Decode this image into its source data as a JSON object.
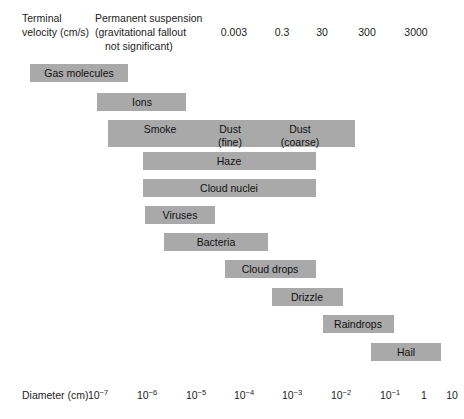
{
  "header": {
    "velocity_label_line1": "Terminal",
    "velocity_label_line2": "velocity (cm/s)",
    "suspension_line1": "Permanent suspension",
    "suspension_line2": "(gravitational fallout",
    "suspension_line3": "not significant)"
  },
  "velocity_values": [
    {
      "label": "0.003",
      "x": 234
    },
    {
      "label": "0.3",
      "x": 282
    },
    {
      "label": "30",
      "x": 322
    },
    {
      "label": "300",
      "x": 367
    },
    {
      "label": "3000",
      "x": 416
    }
  ],
  "axis": {
    "label": "Diameter (cm)",
    "ticks": [
      {
        "base": "10",
        "exp": "−7",
        "x": 98
      },
      {
        "base": "10",
        "exp": "−6",
        "x": 147
      },
      {
        "base": "10",
        "exp": "−5",
        "x": 196
      },
      {
        "base": "10",
        "exp": "−4",
        "x": 244
      },
      {
        "base": "10",
        "exp": "−3",
        "x": 292
      },
      {
        "base": "10",
        "exp": "−2",
        "x": 341
      },
      {
        "base": "10",
        "exp": "−1",
        "x": 390
      },
      {
        "base": "1",
        "exp": "",
        "x": 424
      },
      {
        "base": "10",
        "exp": "",
        "x": 452
      }
    ]
  },
  "chart_data": {
    "type": "bar",
    "title": "",
    "xlabel": "Diameter (cm)",
    "ylabel": "",
    "xlim": [
      "1e-7",
      "1e1"
    ],
    "grid": false,
    "legend": "none",
    "bars": [
      {
        "name": "Gas molecules",
        "labels": [
          "Gas molecules"
        ],
        "x": 30,
        "y": 64,
        "width": 98,
        "height": 18,
        "label_positions": [
          {
            "cx": 79,
            "cy": 67
          }
        ],
        "x_start": "1e-7.4",
        "x_end": "1e-5.4"
      },
      {
        "name": "Ions",
        "labels": [
          "Ions"
        ],
        "x": 97,
        "y": 93,
        "width": 89,
        "height": 18,
        "label_positions": [
          {
            "cx": 142,
            "cy": 96
          }
        ],
        "x_start": "1e-7.0",
        "x_end": "1e-5.2"
      },
      {
        "name": "Smoke / Dust",
        "labels": [
          "Smoke",
          "Dust\n(fine)",
          "Dust\n(coarse)"
        ],
        "x": 108,
        "y": 120,
        "width": 247,
        "height": 27,
        "label_positions": [
          {
            "cx": 160,
            "cy": 123
          },
          {
            "cx": 230,
            "cy": 123
          },
          {
            "cx": 300,
            "cy": 123
          }
        ],
        "x_start": "1e-6.8",
        "x_end": "1e-1.7"
      },
      {
        "name": "Haze",
        "labels": [
          "Haze"
        ],
        "x": 143,
        "y": 152,
        "width": 173,
        "height": 18,
        "label_positions": [
          {
            "cx": 229,
            "cy": 155
          }
        ],
        "x_start": "1e-6.1",
        "x_end": "1e-2.5"
      },
      {
        "name": "Cloud nuclei",
        "labels": [
          "Cloud nuclei"
        ],
        "x": 143,
        "y": 179,
        "width": 173,
        "height": 18,
        "label_positions": [
          {
            "cx": 229,
            "cy": 182
          }
        ],
        "x_start": "1e-6.1",
        "x_end": "1e-2.5"
      },
      {
        "name": "Viruses",
        "labels": [
          "Viruses"
        ],
        "x": 145,
        "y": 206,
        "width": 70,
        "height": 18,
        "label_positions": [
          {
            "cx": 180,
            "cy": 209
          }
        ],
        "x_start": "1e-6.0",
        "x_end": "1e-4.6"
      },
      {
        "name": "Bacteria",
        "labels": [
          "Bacteria"
        ],
        "x": 164,
        "y": 233,
        "width": 104,
        "height": 18,
        "label_positions": [
          {
            "cx": 216,
            "cy": 236
          }
        ],
        "x_start": "1e-5.6",
        "x_end": "1e-3.5"
      },
      {
        "name": "Cloud drops",
        "labels": [
          "Cloud drops"
        ],
        "x": 225,
        "y": 260,
        "width": 91,
        "height": 18,
        "label_positions": [
          {
            "cx": 270,
            "cy": 263
          }
        ],
        "x_start": "1e-4.4",
        "x_end": "1e-2.5"
      },
      {
        "name": "Drizzle",
        "labels": [
          "Drizzle"
        ],
        "x": 272,
        "y": 288,
        "width": 71,
        "height": 18,
        "label_positions": [
          {
            "cx": 307,
            "cy": 291
          }
        ],
        "x_start": "1e-3.4",
        "x_end": "1e-2.0"
      },
      {
        "name": "Raindrops",
        "labels": [
          "Raindrops"
        ],
        "x": 323,
        "y": 315,
        "width": 71,
        "height": 18,
        "label_positions": [
          {
            "cx": 358,
            "cy": 318
          }
        ],
        "x_start": "1e-2.4",
        "x_end": "1e-1.0"
      },
      {
        "name": "Hail",
        "labels": [
          "Hail"
        ],
        "x": 371,
        "y": 343,
        "width": 70,
        "height": 18,
        "label_positions": [
          {
            "cx": 406,
            "cy": 346
          }
        ],
        "x_start": "1e-1.4",
        "x_end": "1e0.2"
      }
    ],
    "velocity_scale": {
      "header": "Terminal velocity (cm/s)",
      "suspension_note": "Permanent suspension (gravitational fallout not significant)",
      "values": [
        "0.003",
        "0.3",
        "30",
        "300",
        "3000"
      ]
    },
    "colors": {
      "bar_fill": "#a9a9a9",
      "text": "#1a1a1a",
      "background": "#ffffff"
    }
  }
}
